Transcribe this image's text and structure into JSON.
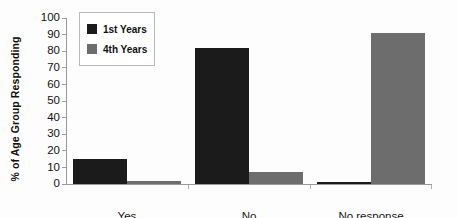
{
  "chart_data": {
    "type": "bar",
    "title": "",
    "subtitle": "",
    "xlabel": "",
    "ylabel": "% of Age Group Responding",
    "categories": [
      "Yes",
      "No",
      "No response"
    ],
    "series": [
      {
        "name": "1st Years",
        "color": "#1b1b1b",
        "values": [
          15,
          82,
          1
        ]
      },
      {
        "name": "4th Years",
        "color": "#6d6d6d",
        "values": [
          2,
          7,
          91
        ]
      }
    ],
    "ylim": [
      0,
      100
    ],
    "ytick_step": 10,
    "yticks": [
      100,
      90,
      80,
      70,
      60,
      50,
      40,
      30,
      20,
      10,
      0
    ],
    "ytick_labels": [
      "100",
      "90",
      "80",
      "70",
      "60",
      "50",
      "40",
      "30",
      "20",
      "10",
      "0"
    ],
    "grid": false,
    "legend_position": "upper-left-inside",
    "annotations": []
  }
}
